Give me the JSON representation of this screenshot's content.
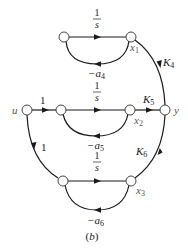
{
  "diagram": {
    "type": "signal-flow-graph",
    "caption": "(b)",
    "nodes": [
      {
        "id": "u",
        "label": "u"
      },
      {
        "id": "n1",
        "label": ""
      },
      {
        "id": "x1",
        "label": "x",
        "sub": "1"
      },
      {
        "id": "n2",
        "label": ""
      },
      {
        "id": "x2",
        "label": "x",
        "sub": "2"
      },
      {
        "id": "n3",
        "label": ""
      },
      {
        "id": "x3",
        "label": "x",
        "sub": "3"
      },
      {
        "id": "y",
        "label": "y"
      }
    ],
    "edges": [
      {
        "from": "u",
        "to": "n2",
        "gain": "1"
      },
      {
        "from": "u",
        "to": "n3",
        "gain": "1"
      },
      {
        "from": "n1",
        "to": "x1",
        "gain_num": "1",
        "gain_den": "s"
      },
      {
        "from": "x1",
        "to": "n1",
        "gain": "−a",
        "gain_sub": "4"
      },
      {
        "from": "n2",
        "to": "x2",
        "gain_num": "1",
        "gain_den": "s"
      },
      {
        "from": "x2",
        "to": "n2",
        "gain": "−a",
        "gain_sub": "5"
      },
      {
        "from": "n3",
        "to": "x3",
        "gain_num": "1",
        "gain_den": "s"
      },
      {
        "from": "x3",
        "to": "n3",
        "gain": "−a",
        "gain_sub": "6"
      },
      {
        "from": "x1",
        "to": "y",
        "gain": "K",
        "gain_sub": "4"
      },
      {
        "from": "x2",
        "to": "y",
        "gain": "K",
        "gain_sub": "5"
      },
      {
        "from": "x3",
        "to": "y",
        "gain": "K",
        "gain_sub": "6"
      }
    ]
  },
  "labels": {
    "u": "u",
    "y": "y",
    "x": "x",
    "x1_sub": "1",
    "x2_sub": "2",
    "x3_sub": "3",
    "one": "1",
    "s": "s",
    "minus_a": "−a",
    "a4_sub": "4",
    "a5_sub": "5",
    "a6_sub": "6",
    "K": "K",
    "K4_sub": "4",
    "K5_sub": "5",
    "K6_sub": "6",
    "caption": "(b)"
  },
  "colors": {
    "line": "#1a1a1a",
    "node_fill": "#ffffff",
    "text": "#222222"
  }
}
